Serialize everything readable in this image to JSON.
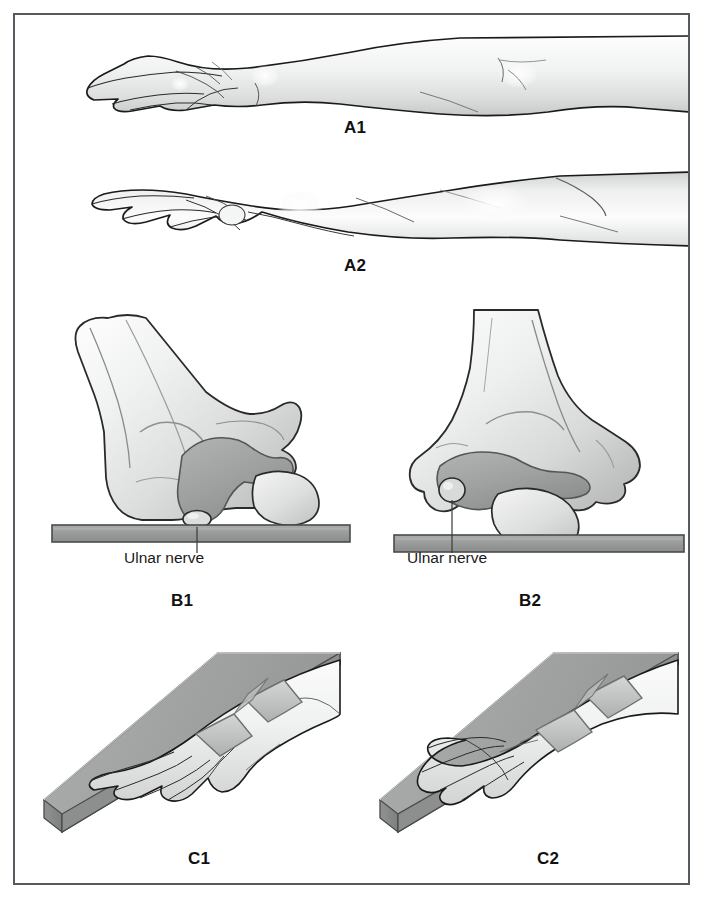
{
  "figure": {
    "kind": "medical-illustration",
    "title_visible": false,
    "border_color": "#555a5e",
    "background_color": "#ffffff",
    "panel_count": 6
  },
  "palette": {
    "outline": "#1a1a1a",
    "skin_light": "#fbfbfb",
    "skin_mid": "#e9eaea",
    "skin_shadow": "#c9cbcb",
    "bone_light": "#f2f2f2",
    "bone_mid": "#d7d8d8",
    "bone_dark": "#a9abab",
    "cartilage_gray": "#9fa1a1",
    "table_gray": "#9a9c9c",
    "table_edge": "#4a4c4c",
    "board_top": "#a3a5a5",
    "board_side": "#8a8c8c",
    "board_edge": "#cfd0d0",
    "strap_gray": "#c4c6c6",
    "strap_line": "#6e7070",
    "leader_line": "#3a3a3a"
  },
  "panels": [
    {
      "id": "A1",
      "label": "A1",
      "caption": "Forearm pronated, hand palm-down",
      "label_x": 352,
      "label_y": 128,
      "row": "A",
      "column": "full"
    },
    {
      "id": "A2",
      "label": "A2",
      "caption": "Forearm supinated, hand palm-up",
      "label_x": 352,
      "label_y": 266,
      "row": "A",
      "column": "full"
    },
    {
      "id": "B1",
      "label": "B1",
      "caption": "Elbow pronated on table, ulnar nerve compressed",
      "label_x": 179,
      "label_y": 601,
      "row": "B",
      "column": "left"
    },
    {
      "id": "B2",
      "label": "B2",
      "caption": "Elbow supinated on table, ulnar nerve free",
      "label_x": 527,
      "label_y": 601,
      "row": "B",
      "column": "right"
    },
    {
      "id": "C1",
      "label": "C1",
      "caption": "Arm strapped to board, hand pronated",
      "label_x": 196,
      "label_y": 859,
      "row": "C",
      "column": "left"
    },
    {
      "id": "C2",
      "label": "C2",
      "caption": "Arm strapped to board, hand supinated",
      "label_x": 545,
      "label_y": 859,
      "row": "C",
      "column": "right"
    }
  ],
  "annotations": [
    {
      "id": "ulnar-nerve-b1",
      "text": "Ulnar nerve",
      "panel": "B1",
      "text_x": 124,
      "text_y": 558,
      "leader": {
        "x1": 197,
        "y1": 553,
        "x2": 197,
        "y2": 517
      }
    },
    {
      "id": "ulnar-nerve-b2",
      "text": "Ulnar nerve",
      "panel": "B2",
      "text_x": 407,
      "text_y": 558,
      "leader": {
        "x1": 452,
        "y1": 553,
        "x2": 452,
        "y2": 490
      }
    }
  ],
  "straps": {
    "count_per_panel": 2,
    "color": "#c4c6c6"
  }
}
